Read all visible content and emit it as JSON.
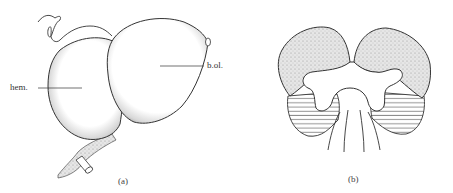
{
  "figure": {
    "panels": [
      {
        "id": "a",
        "caption": "(a)",
        "labels": [
          {
            "text": "hem.",
            "target": "hemisphere"
          },
          {
            "text": "b.ol.",
            "target": "olfactory bulb"
          }
        ]
      },
      {
        "id": "b",
        "caption": "(b)",
        "legend": {
          "stippled": "upper lobes (stippled)",
          "hatched": "lower regions (horizontal hatching)"
        }
      }
    ],
    "colors": {
      "line": "#333333",
      "stipple": "#9a9a9a",
      "background": "#ffffff"
    }
  }
}
